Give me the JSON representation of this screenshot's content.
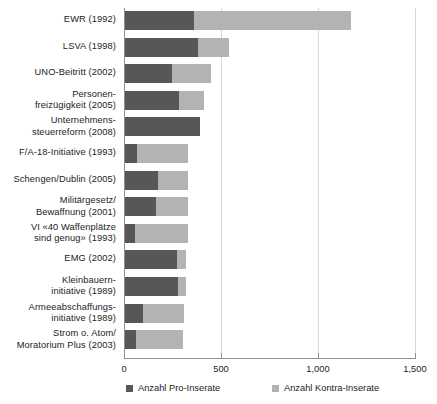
{
  "chart_data": {
    "type": "bar",
    "orientation": "horizontal",
    "stacked": true,
    "title": "",
    "xlabel": "",
    "ylabel": "",
    "xlim": [
      0,
      1500
    ],
    "xticks": [
      0,
      500,
      1000,
      1500
    ],
    "xtick_labels": [
      "0",
      "500",
      "1,000",
      "1,500"
    ],
    "grid": "vertical",
    "legend_position": "bottom",
    "colors": {
      "pro": "#575757",
      "kontra": "#b3b3b3",
      "axis": "#8f8f8f",
      "gridline": "#d8d8d8",
      "text": "#1c1c1c",
      "background": "#ffffff"
    },
    "categories": [
      "EWR (1992)",
      "LSVA (1998)",
      "UNO-Beitritt (2002)",
      "Personen-\nfreizügigkeit (2005)",
      "Unternehmens-\nsteuerreform (2008)",
      "F/A-18-Initiative (1993)",
      "Schengen/Dublin (2005)",
      "Militärgesetz/\nBewaffnung (2001)",
      "VI «40 Waffenplätze\nsind genug» (1993)",
      "EMG (2002)",
      "Kleinbauern-\ninitiative (1989)",
      "Armeeabschaffungs-\ninitiative (1989)",
      "Strom o. Atom/\nMoratorium Plus (2003)"
    ],
    "series": [
      {
        "name": "Anzahl Pro-Inserate",
        "color": "#575757",
        "values": [
          355,
          376,
          242,
          278,
          386,
          62,
          170,
          160,
          52,
          268,
          273,
          93,
          57
        ]
      },
      {
        "name": "Anzahl Kontra-Inserate",
        "color": "#b3b3b3",
        "values": [
          810,
          160,
          201,
          129,
          0,
          263,
          155,
          165,
          273,
          46,
          41,
          211,
          241
        ]
      }
    ],
    "totals": [
      1165,
      536,
      443,
      407,
      386,
      325,
      325,
      325,
      325,
      314,
      314,
      304,
      298
    ]
  },
  "legend": {
    "items": [
      {
        "label": "Anzahl Pro-Inserate",
        "swatch": "pro-swatch"
      },
      {
        "label": "Anzahl Kontra-Inserate",
        "swatch": "kontra-swatch"
      }
    ]
  }
}
